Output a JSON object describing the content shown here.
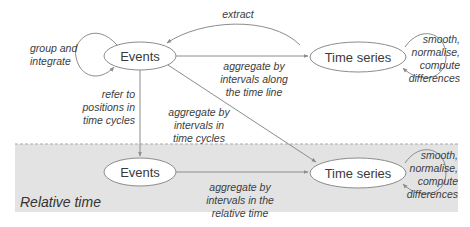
{
  "diagram": {
    "colors": {
      "background": "#ffffff",
      "band_fill": "#e3e3e3",
      "band_border": "#a8a8a8",
      "node_fill": "#ffffff",
      "node_stroke": "#8c8c8c",
      "edge": "#8c8c8c",
      "text": "#3a3a3a"
    },
    "band": {
      "label": "Relative time"
    },
    "nodes": {
      "events_top": {
        "label": "Events"
      },
      "timeseries_top": {
        "label": "Time series"
      },
      "events_bottom": {
        "label": "Events"
      },
      "timeseries_bottom": {
        "label": "Time series"
      }
    },
    "edges": {
      "group_integrate": {
        "label": "group and\nintegrate"
      },
      "extract": {
        "label": "extract"
      },
      "aggregate_timeline": {
        "label": "aggregate by\nintervals along\nthe time line"
      },
      "refer_positions": {
        "label": "refer to\npositions in\ntime cycles"
      },
      "aggregate_cycles": {
        "label": "aggregate by\nintervals in\ntime cycles"
      },
      "smooth_top": {
        "label": "smooth,\nnormalise,\ncompute\ndifferences"
      },
      "aggregate_relative": {
        "label": "aggregate by\nintervals in the\nrelative time"
      },
      "smooth_bottom": {
        "label": "smooth,\nnormalise,\ncompute\ndifferences"
      }
    }
  }
}
